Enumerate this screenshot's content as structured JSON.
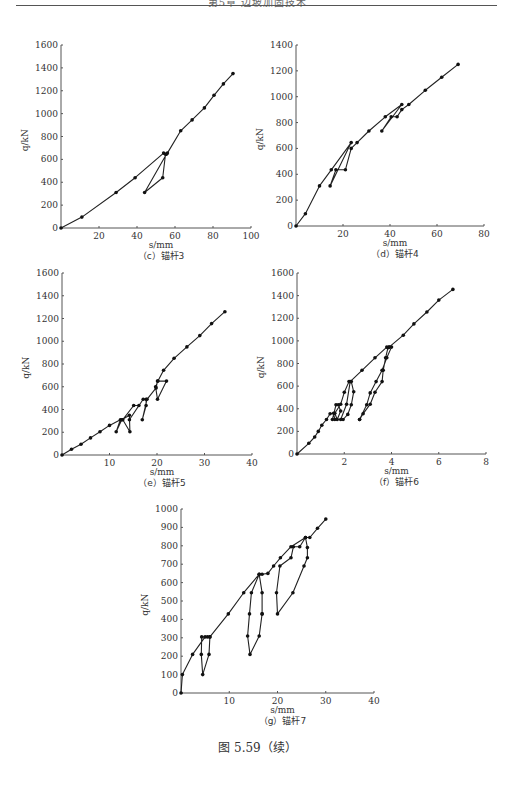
{
  "header": {
    "text": "第5章  边坡加固技术"
  },
  "figure_caption": "图 5.59（续）",
  "chart_data": [
    {
      "id": "c",
      "type": "line",
      "caption": "（c）锚杆3",
      "xlabel": "s/mm",
      "ylabel": "q/kN",
      "xlim": [
        0,
        100
      ],
      "ylim": [
        0,
        1600
      ],
      "xticks": [
        20,
        40,
        60,
        80,
        100
      ],
      "yticks": [
        0,
        200,
        400,
        600,
        800,
        1000,
        1200,
        1400,
        1600
      ],
      "grid": false,
      "layout": {
        "ox": 61,
        "oy": 228,
        "xw": 190,
        "yh": 183
      },
      "series": [
        {
          "name": "q-s",
          "x": [
            0,
            11,
            29,
            39,
            54,
            55.5,
            44,
            53.5,
            55,
            56,
            63,
            69,
            75.5,
            80.5,
            85.5,
            90.5
          ],
          "y": [
            0,
            95,
            310,
            440,
            655,
            645,
            310,
            440,
            645,
            655,
            850,
            945,
            1050,
            1160,
            1260,
            1350
          ]
        }
      ]
    },
    {
      "id": "d",
      "type": "line",
      "caption": "（d）锚杆4",
      "xlabel": "s/mm",
      "ylabel": "q/kN",
      "xlim": [
        0,
        80
      ],
      "ylim": [
        0,
        1400
      ],
      "xticks": [
        20,
        40,
        60,
        80
      ],
      "yticks": [
        0,
        200,
        400,
        600,
        800,
        1000,
        1200,
        1400
      ],
      "grid": false,
      "layout": {
        "ox": 296,
        "oy": 226,
        "xw": 188,
        "yh": 181
      },
      "series": [
        {
          "name": "q-s",
          "x": [
            0,
            4,
            10,
            15,
            23.5,
            14.5,
            17,
            21,
            23.5,
            26,
            31,
            38,
            45,
            36.5,
            40.5,
            43,
            45,
            48,
            55,
            62,
            69
          ],
          "y": [
            0,
            95,
            310,
            435,
            645,
            310,
            435,
            435,
            600,
            645,
            735,
            845,
            940,
            735,
            845,
            845,
            900,
            940,
            1050,
            1150,
            1250
          ]
        }
      ]
    },
    {
      "id": "e",
      "type": "line",
      "caption": "（e）锚杆5",
      "xlabel": "s/mm",
      "ylabel": "q/kN",
      "xlim": [
        0,
        40
      ],
      "ylim": [
        0,
        1600
      ],
      "xticks": [
        10,
        20,
        30,
        40
      ],
      "yticks": [
        0,
        200,
        400,
        600,
        800,
        1000,
        1200,
        1400,
        1600
      ],
      "grid": false,
      "layout": {
        "ox": 62,
        "oy": 455,
        "xw": 190,
        "yh": 182
      },
      "series": [
        {
          "name": "q-s",
          "x": [
            0,
            2,
            4,
            6,
            8,
            10,
            12.3,
            11.4,
            12.6,
            14.2,
            14.3,
            12.8,
            15.1,
            16.2,
            14.2,
            17.1,
            17.7,
            17.7,
            16.9,
            17.9,
            19.8,
            20.1,
            22,
            20.1,
            19.7,
            20.2,
            21.4,
            23.6,
            26.3,
            29,
            31.5,
            34.3
          ],
          "y": [
            0,
            50,
            95,
            150,
            205,
            260,
            310,
            205,
            310,
            350,
            205,
            310,
            435,
            435,
            310,
            490,
            490,
            435,
            310,
            490,
            590,
            650,
            650,
            490,
            600,
            650,
            745,
            850,
            950,
            1050,
            1155,
            1260
          ]
        }
      ]
    },
    {
      "id": "f",
      "type": "line",
      "caption": "（f）锚杆6",
      "xlabel": "s/mm",
      "ylabel": "q/kN",
      "xlim": [
        0,
        8
      ],
      "ylim": [
        0,
        1600
      ],
      "xticks": [
        2,
        4,
        6,
        8
      ],
      "yticks": [
        0,
        200,
        400,
        600,
        800,
        1000,
        1200,
        1400,
        1600
      ],
      "grid": false,
      "layout": {
        "ox": 297,
        "oy": 454,
        "xw": 189,
        "yh": 181
      },
      "series": [
        {
          "name": "q-s",
          "x": [
            0,
            0.5,
            0.75,
            0.9,
            1.05,
            1.25,
            1.4,
            1.55,
            1.6,
            1.5,
            1.65,
            1.75,
            1.85,
            1.7,
            1.6,
            1.85,
            2.0,
            2.2,
            2.3,
            2.4,
            2.3,
            2.15,
            1.95,
            1.85,
            2.1,
            2.25,
            2.75,
            3.3,
            3.8,
            3.9,
            4.0,
            3.8,
            3.6,
            3.35,
            3.1,
            2.95,
            2.65,
            2.65,
            2.8,
            3.1,
            3.3,
            3.6,
            3.65,
            3.75,
            3.85,
            3.9,
            4.5,
            4.95,
            5.5,
            6.0,
            6.6
          ],
          "y": [
            0,
            95,
            150,
            200,
            255,
            305,
            355,
            360,
            305,
            305,
            435,
            435,
            380,
            305,
            360,
            440,
            545,
            640,
            640,
            550,
            435,
            350,
            305,
            305,
            440,
            640,
            740,
            850,
            945,
            945,
            945,
            850,
            740,
            640,
            540,
            435,
            305,
            305,
            355,
            440,
            545,
            640,
            740,
            850,
            940,
            945,
            1050,
            1150,
            1255,
            1360,
            1455
          ]
        }
      ]
    },
    {
      "id": "g",
      "type": "line",
      "caption": "（g）锚杆7",
      "xlabel": "s/mm",
      "ylabel": "q/kN",
      "xlim": [
        0,
        40
      ],
      "ylim": [
        0,
        1000
      ],
      "xticks": [
        10,
        20,
        30,
        40
      ],
      "yticks": [
        0,
        100,
        200,
        300,
        400,
        500,
        600,
        700,
        800,
        900,
        1000
      ],
      "grid": false,
      "layout": {
        "ox": 181,
        "oy": 693,
        "xw": 193,
        "yh": 184
      },
      "series": [
        {
          "name": "q-s",
          "x": [
            0,
            0.3,
            2.4,
            5,
            6,
            5.8,
            4.5,
            4.2,
            4.3,
            5.5,
            6,
            9.8,
            13,
            16.2,
            16.8,
            16.8,
            16.8,
            16.2,
            14.3,
            13.8,
            14.2,
            14.6,
            16.2,
            16.8,
            18,
            19.2,
            20.6,
            22.8,
            25.8,
            26.2,
            26.2,
            25.5,
            23.2,
            20,
            19.8,
            20.5,
            22.8,
            23.3,
            24.6,
            25.8,
            26.7,
            28.3,
            30
          ],
          "y": [
            0,
            100,
            210,
            305,
            305,
            210,
            100,
            210,
            305,
            305,
            305,
            430,
            545,
            645,
            545,
            430,
            430,
            310,
            210,
            310,
            430,
            545,
            645,
            645,
            650,
            690,
            735,
            795,
            845,
            790,
            735,
            690,
            545,
            430,
            545,
            690,
            735,
            795,
            795,
            845,
            845,
            895,
            945
          ]
        }
      ]
    }
  ]
}
